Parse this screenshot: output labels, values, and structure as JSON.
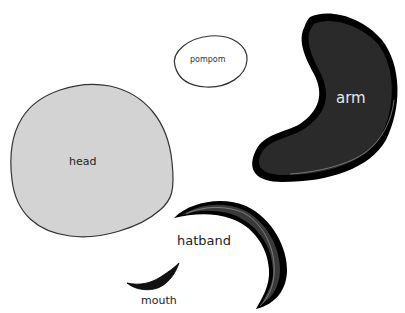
{
  "diagram": {
    "type": "cut-out shape pieces",
    "pieces": [
      {
        "id": "pompom",
        "label": "pompom",
        "fill": "#ffffff",
        "stroke": "#333333"
      },
      {
        "id": "arm",
        "label": "arm",
        "fill": "#2a2a2a",
        "stroke": "#000000"
      },
      {
        "id": "head",
        "label": "head",
        "fill": "#d3d3d3",
        "stroke": "#333333"
      },
      {
        "id": "hatband",
        "label": "hatband",
        "fill": "#3a3a3a",
        "stroke": "#000000"
      },
      {
        "id": "mouth",
        "label": "mouth",
        "fill": "#111111",
        "stroke": "#000000"
      }
    ]
  },
  "colors": {
    "background": "#ffffff",
    "head_fill": "#d3d3d3",
    "arm_fill": "#2a2a2a",
    "hatband_fill": "#3a3a3a",
    "outline": "#000000"
  }
}
